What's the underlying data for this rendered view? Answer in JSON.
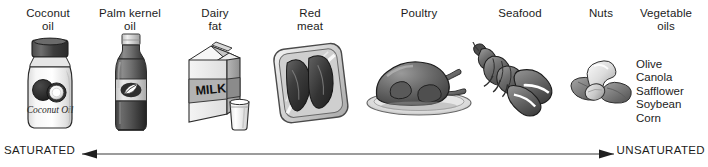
{
  "diagram": {
    "columns": [
      {
        "id": "coconut-oil",
        "label": "Coconut\noil",
        "icon": "coconut-oil-jar-icon",
        "center_x": 48,
        "label_top": 7
      },
      {
        "id": "palm-kernel-oil",
        "label": "Palm kernel\noil",
        "icon": "palm-kernel-oil-bottle-icon",
        "center_x": 130,
        "label_top": 7
      },
      {
        "id": "dairy-fat",
        "label": "Dairy\nfat",
        "icon": "milk-carton-icon",
        "center_x": 215,
        "label_top": 7
      },
      {
        "id": "red-meat",
        "label": "Red\nmeat",
        "icon": "red-meat-tray-icon",
        "center_x": 310,
        "label_top": 7
      },
      {
        "id": "poultry",
        "label": "Poultry",
        "icon": "roast-poultry-icon",
        "center_x": 419,
        "label_top": 7
      },
      {
        "id": "seafood",
        "label": "Seafood",
        "icon": "lobster-icon",
        "center_x": 520,
        "label_top": 7
      },
      {
        "id": "nuts",
        "label": "Nuts",
        "icon": "nuts-icon",
        "center_x": 601,
        "label_top": 7
      },
      {
        "id": "vegetable-oils",
        "label": "Vegetable\noils",
        "icon": "vegetable-oils-list",
        "center_x": 666,
        "label_top": 7
      }
    ],
    "jar_label": "Coconut Oil",
    "carton_label": "MILK",
    "vegetable_oils": [
      "Olive",
      "Canola",
      "Safflower",
      "Soybean",
      "Corn"
    ],
    "scale": {
      "left_label": "SATURATED",
      "right_label": "UNSATURATED",
      "line_color": "#3a3a3a",
      "arrow_left": true,
      "arrow_right": true
    },
    "colors": {
      "ink": "#1c1c1c",
      "line": "#3a3a3a",
      "light_gray": "#e4e4e4",
      "mid_gray": "#9a9a9a",
      "dark_gray": "#585858",
      "near_black": "#2b2b2b",
      "white": "#ffffff"
    }
  }
}
